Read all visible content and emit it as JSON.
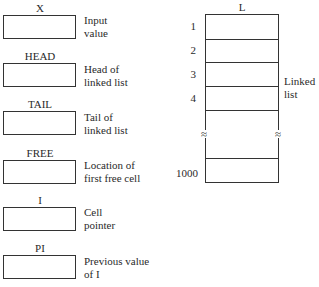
{
  "variables": [
    {
      "name": "X",
      "description": "Input\nvalue"
    },
    {
      "name": "HEAD",
      "description": "Head of\nlinked list"
    },
    {
      "name": "TAIL",
      "description": "Tail of\nlinked list"
    },
    {
      "name": "FREE",
      "description": "Location of\nfirst free cell"
    },
    {
      "name": "I",
      "description": "Cell\npointer"
    },
    {
      "name": "PI",
      "description": "Previous value\nof I"
    }
  ],
  "array": {
    "name": "L",
    "row_labels": [
      "1",
      "2",
      "3",
      "4",
      "1000"
    ],
    "break_symbol": "≈",
    "description": "Linked\nlist"
  }
}
